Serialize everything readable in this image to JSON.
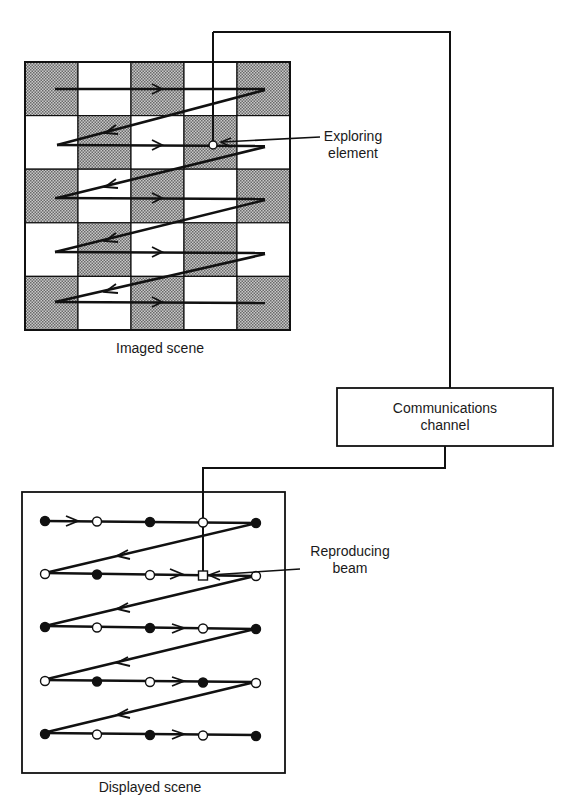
{
  "diagram": {
    "imaged_scene": {
      "label": "Imaged scene",
      "grid": {
        "rows": 5,
        "cols": 5,
        "pattern": "checkerboard",
        "first_cell": "shaded"
      },
      "callout": {
        "label_line1": "Exploring",
        "label_line2": "element"
      }
    },
    "channel": {
      "label_line1": "Communications",
      "label_line2": "channel"
    },
    "displayed_scene": {
      "label": "Displayed scene",
      "rows": [
        [
          "filled",
          "open",
          "filled",
          "open",
          "filled"
        ],
        [
          "open",
          "filled",
          "open",
          "square",
          "open"
        ],
        [
          "filled",
          "open",
          "filled",
          "open",
          "filled"
        ],
        [
          "open",
          "filled",
          "open",
          "filled",
          "open"
        ],
        [
          "filled",
          "open",
          "filled",
          "open",
          "filled"
        ]
      ],
      "callout": {
        "label_line1": "Reproducing",
        "label_line2": "beam"
      }
    },
    "colors": {
      "line": "#111111",
      "shade": "#9a9a9a",
      "background": "#ffffff"
    }
  }
}
